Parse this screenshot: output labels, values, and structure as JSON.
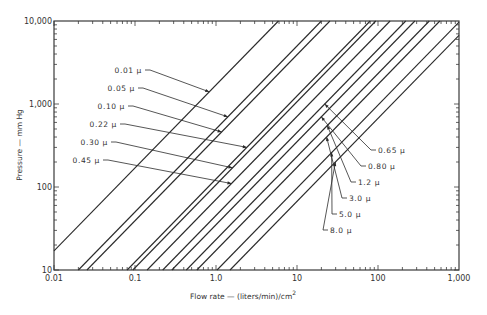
{
  "chart_data": {
    "type": "line",
    "title": "",
    "xlabel": "Flow rate — (liters/min)/cm²",
    "ylabel": "Pressure — mm Hg",
    "xscale": "log",
    "yscale": "log",
    "xlim": [
      0.01,
      1000
    ],
    "ylim": [
      10,
      10000
    ],
    "grid": false,
    "legend": "inline-annotations",
    "x_ticks": [
      "0.01",
      "0.1",
      "1.0",
      "10",
      "100",
      "1,000"
    ],
    "y_ticks": [
      "10",
      "100",
      "1,000",
      "10,000"
    ],
    "series_note": "Each line: Pressure proportional to flow rate (slope 1 on log-log). flow_at_10mmHg is the flow rate where the line crosses P = 10 mm Hg.",
    "series": [
      {
        "name": "0.01 μ",
        "flow_at_10mmHg": 0.0059,
        "points": [
          [
            0.01,
            17
          ],
          [
            5.9,
            10000
          ]
        ]
      },
      {
        "name": "0.05 μ",
        "flow_at_10mmHg": 0.02,
        "points": [
          [
            0.02,
            10
          ],
          [
            20,
            10000
          ]
        ]
      },
      {
        "name": "0.10 μ",
        "flow_at_10mmHg": 0.0255,
        "points": [
          [
            0.0255,
            10
          ],
          [
            25.5,
            10000
          ]
        ]
      },
      {
        "name": "0.22 μ",
        "flow_at_10mmHg": 0.08,
        "points": [
          [
            0.08,
            10
          ],
          [
            80,
            10000
          ]
        ]
      },
      {
        "name": "0.30 μ",
        "flow_at_10mmHg": 0.094,
        "points": [
          [
            0.094,
            10
          ],
          [
            94,
            10000
          ]
        ]
      },
      {
        "name": "0.45 μ",
        "flow_at_10mmHg": 0.141,
        "points": [
          [
            0.141,
            10
          ],
          [
            141,
            10000
          ]
        ]
      },
      {
        "name": "0.65 μ",
        "flow_at_10mmHg": 0.22,
        "points": [
          [
            0.22,
            10
          ],
          [
            220,
            10000
          ]
        ]
      },
      {
        "name": "0.80 μ",
        "flow_at_10mmHg": 0.285,
        "points": [
          [
            0.285,
            10
          ],
          [
            285,
            10000
          ]
        ]
      },
      {
        "name": "1.2 μ",
        "flow_at_10mmHg": 0.43,
        "points": [
          [
            0.43,
            10
          ],
          [
            430,
            10000
          ]
        ]
      },
      {
        "name": "3.0 μ",
        "flow_at_10mmHg": 0.58,
        "points": [
          [
            0.58,
            10
          ],
          [
            580,
            10000
          ]
        ]
      },
      {
        "name": "5.0 μ",
        "flow_at_10mmHg": 1.03,
        "points": [
          [
            1.03,
            10
          ],
          [
            1000,
            9700
          ]
        ]
      },
      {
        "name": "8.0 μ",
        "flow_at_10mmHg": 1.49,
        "points": [
          [
            1.49,
            10
          ],
          [
            1000,
            6700
          ]
        ]
      }
    ],
    "annotations": {
      "left": [
        {
          "series": "0.01 μ",
          "label_x": 142,
          "label_y": 70,
          "target_P": 1400
        },
        {
          "series": "0.05 μ",
          "label_x": 135,
          "label_y": 88,
          "target_P": 700
        },
        {
          "series": "0.10 μ",
          "label_x": 125,
          "label_y": 106,
          "target_P": 460
        },
        {
          "series": "0.22 μ",
          "label_x": 117,
          "label_y": 124,
          "target_P": 300
        },
        {
          "series": "0.30 μ",
          "label_x": 108,
          "label_y": 142,
          "target_P": 170
        },
        {
          "series": "0.45 μ",
          "label_x": 100,
          "label_y": 160,
          "target_P": 110
        }
      ],
      "right": [
        {
          "series": "0.65 μ",
          "label_x": 378,
          "label_y": 150,
          "target_P": 1000
        },
        {
          "series": "0.80 μ",
          "label_x": 368,
          "label_y": 166,
          "target_P": 700
        },
        {
          "series": "1.2 μ",
          "label_x": 358,
          "label_y": 182,
          "target_P": 550
        },
        {
          "series": "3.0 μ",
          "label_x": 349,
          "label_y": 198,
          "target_P": 400
        },
        {
          "series": "5.0 μ",
          "label_x": 339,
          "label_y": 214,
          "target_P": 260
        },
        {
          "series": "8.0 μ",
          "label_x": 330,
          "label_y": 230,
          "target_P": 200
        }
      ]
    }
  },
  "axes": {
    "x_title": "Flow rate — (liters/min)/cm",
    "x_title_sup": "2",
    "y_title": "Pressure — mm Hg"
  },
  "colors": {
    "line": "#2b2b2b",
    "axis": "#3a3a3a",
    "text": "#333333",
    "background": "#ffffff"
  }
}
